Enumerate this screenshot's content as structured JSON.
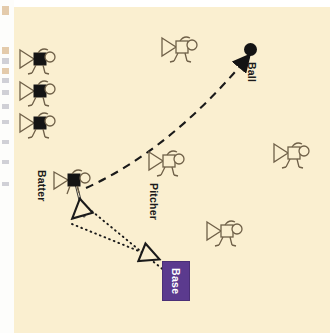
{
  "diagram": {
    "background_color": "#faefd0",
    "margin_color": "#ffffff",
    "labels": {
      "ball": "Ball",
      "base": "Base",
      "batter": "Batter",
      "pitcher": "Pitcher"
    },
    "colors": {
      "base_fill": "#5b3a8e",
      "base_text": "#ffffff",
      "ball_fill": "#141414",
      "figure_outline": "#8a7a5e",
      "figure_fill_dark": "#141414",
      "figure_fill_light": "#faefd0",
      "trajectory": "#1a1a1a"
    },
    "markers": [
      {
        "name": "ball-marker",
        "label": "Ball",
        "x": 250,
        "y": 48
      },
      {
        "name": "base-marker",
        "label": "Base",
        "x": 162,
        "y": 262
      }
    ],
    "figures": [
      {
        "name": "fielder-dark-1",
        "team": "batting",
        "fill": "dark",
        "x": 18,
        "y": 48
      },
      {
        "name": "fielder-dark-2",
        "team": "batting",
        "fill": "dark",
        "x": 18,
        "y": 80
      },
      {
        "name": "fielder-dark-3",
        "team": "batting",
        "fill": "dark",
        "x": 18,
        "y": 112
      },
      {
        "name": "batter-figure",
        "team": "batting",
        "fill": "dark",
        "label": "Batter",
        "x": 58,
        "y": 165
      },
      {
        "name": "fielder-light-outfield",
        "team": "fielding",
        "fill": "light",
        "x": 162,
        "y": 35
      },
      {
        "name": "pitcher-figure",
        "team": "fielding",
        "fill": "light",
        "label": "Pitcher",
        "x": 148,
        "y": 148
      },
      {
        "name": "fielder-light-right",
        "team": "fielding",
        "fill": "light",
        "x": 272,
        "y": 140
      },
      {
        "name": "fielder-light-low",
        "team": "fielding",
        "fill": "light",
        "x": 205,
        "y": 218
      }
    ],
    "paths": [
      {
        "name": "ball-trajectory",
        "style": "dashed",
        "from": "batter",
        "to": "ball",
        "arrow": "filled"
      },
      {
        "name": "runner-path-outer",
        "style": "dotted",
        "from": "batter",
        "to": "base",
        "arrow": "hollow"
      },
      {
        "name": "runner-path-inner",
        "style": "dotted",
        "from": "batter",
        "to": "left-field",
        "arrow": "hollow"
      }
    ]
  }
}
